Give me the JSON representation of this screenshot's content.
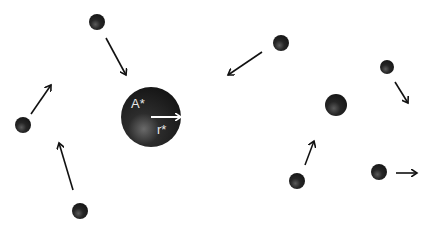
{
  "diagram": {
    "central_particle": {
      "label_area": "A*",
      "label_radius": "r*",
      "cx": 151,
      "cy": 117,
      "r": 30
    },
    "particles": [
      {
        "id": "p1",
        "cx": 97,
        "cy": 22,
        "r": 8,
        "arrow": [
          106,
          38,
          126,
          75
        ]
      },
      {
        "id": "p2",
        "cx": 23,
        "cy": 125,
        "r": 8,
        "arrow": [
          31,
          114,
          51,
          85
        ]
      },
      {
        "id": "p3",
        "cx": 80,
        "cy": 211,
        "r": 8,
        "arrow": [
          73,
          190,
          59,
          143
        ]
      },
      {
        "id": "p4",
        "cx": 281,
        "cy": 43,
        "r": 8,
        "arrow": [
          262,
          52,
          228,
          75
        ]
      },
      {
        "id": "p5",
        "cx": 387,
        "cy": 67,
        "r": 7,
        "arrow": [
          395,
          82,
          408,
          103
        ]
      },
      {
        "id": "p6",
        "cx": 336,
        "cy": 105,
        "r": 11,
        "arrow": null
      },
      {
        "id": "p7",
        "cx": 297,
        "cy": 181,
        "r": 8,
        "arrow": [
          305,
          165,
          314,
          141
        ]
      },
      {
        "id": "p8",
        "cx": 379,
        "cy": 172,
        "r": 8,
        "arrow": [
          396,
          173,
          417,
          173
        ]
      }
    ],
    "colors": {
      "particle": "#1e1e1e",
      "arrow": "#111111",
      "label": "#e8e8e8",
      "background": "#ffffff"
    }
  }
}
